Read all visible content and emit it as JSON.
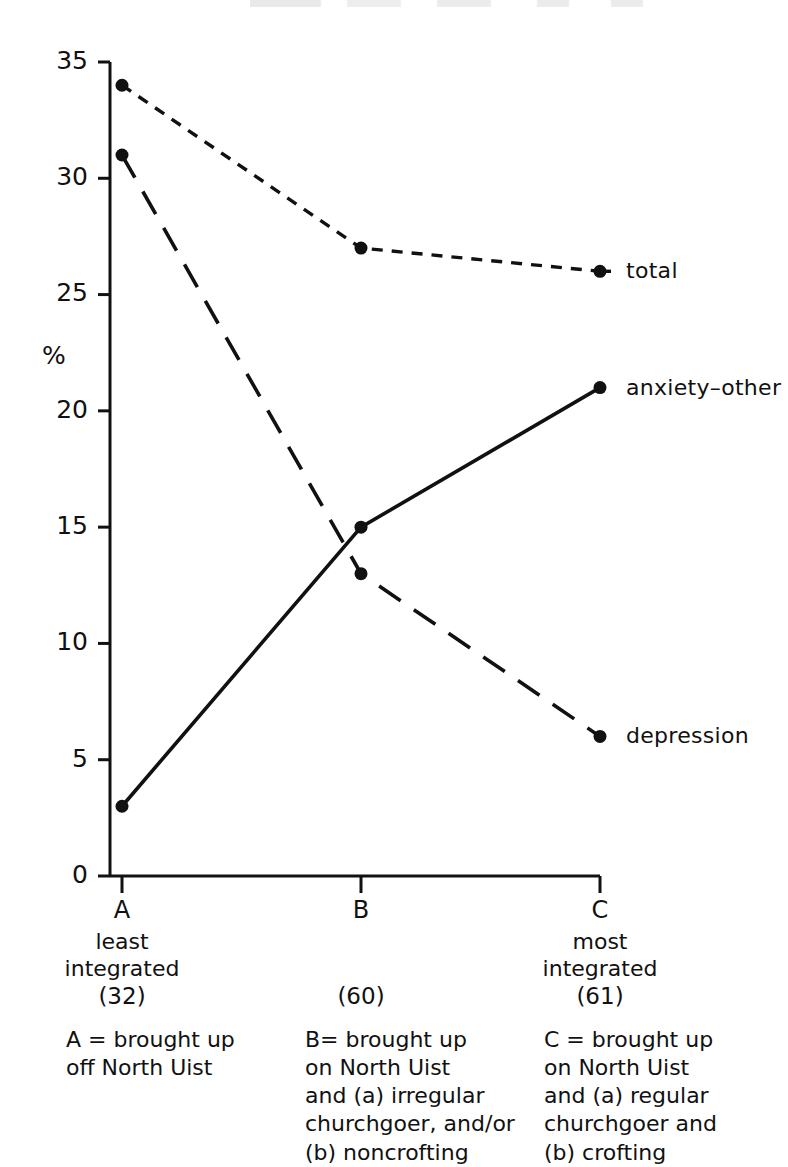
{
  "chart_data": {
    "type": "line",
    "title": "",
    "xlabel": "",
    "ylabel": "%",
    "categories": [
      "A",
      "B",
      "C"
    ],
    "category_sublabels": [
      [
        "least",
        "integrated"
      ],
      [],
      [
        "most",
        "integrated"
      ]
    ],
    "category_counts": [
      "(32)",
      "(60)",
      "(61)"
    ],
    "ylim": [
      0,
      35
    ],
    "yticks": [
      0,
      5,
      10,
      15,
      20,
      25,
      30,
      35
    ],
    "ytick_labels": [
      "0",
      "5",
      "10",
      "15",
      "20",
      "25",
      "30",
      "35"
    ],
    "grid": false,
    "legend_position": "right-inline",
    "series": [
      {
        "name": "total",
        "label": "total",
        "style": "dotted",
        "marker": "filled-circle",
        "values": [
          34,
          27,
          26
        ]
      },
      {
        "name": "anxiety-other",
        "label": "anxiety–other",
        "style": "solid",
        "marker": "filled-circle",
        "values": [
          3,
          15,
          21
        ]
      },
      {
        "name": "depression",
        "label": "depression",
        "style": "dashed",
        "marker": "filled-circle",
        "values": [
          31,
          13,
          6
        ]
      }
    ],
    "annotations": [
      "A = brought up off North Uist",
      "B = brought up on North Uist and (a) irregular churchgoer, and/or (b) noncrofting",
      "C = brought up on North Uist and (a) regular churchgoer and (b) crofting"
    ]
  },
  "axis": {
    "y_title": "%",
    "y_tick_labels": [
      "35",
      "30",
      "25",
      "20",
      "15",
      "10",
      "5",
      "0"
    ],
    "x_tick_labels": [
      "A",
      "B",
      "C"
    ]
  },
  "legend": {
    "total": "total",
    "anxiety_other": "anxiety–other",
    "depression": "depression"
  },
  "x_groups": [
    {
      "letter": "A",
      "desc_line1": "least",
      "desc_line2": "integrated",
      "count": "(32)",
      "note_lines": [
        "A = brought up",
        "off North Uist"
      ]
    },
    {
      "letter": "B",
      "desc_line1": "",
      "desc_line2": "",
      "count": "(60)",
      "note_lines": [
        "B= brought up",
        "on North Uist",
        "and (a) irregular",
        "churchgoer, and/or",
        "(b) noncrofting"
      ]
    },
    {
      "letter": "C",
      "desc_line1": "most",
      "desc_line2": "integrated",
      "count": "(61)",
      "note_lines": [
        "C = brought up",
        "on North Uist",
        "and (a) regular",
        "churchgoer and",
        "(b) crofting"
      ]
    }
  ],
  "colors": {
    "ink": "#111111",
    "background": "#ffffff"
  }
}
